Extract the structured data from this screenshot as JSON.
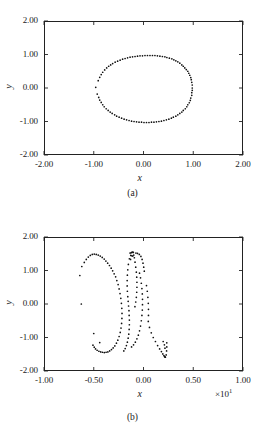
{
  "figure": {
    "panels": [
      {
        "label": "(a)",
        "xlabel": "x",
        "ylabel": "y",
        "xticks": [
          "-2.00",
          "-1.00",
          "0.00",
          "1.00",
          "2.00"
        ],
        "yticks": [
          "2.00",
          "1.00",
          "0.00",
          "-1.00",
          "-2.00"
        ],
        "xmultiplier": "",
        "xlim": [
          -2,
          2
        ],
        "ylim": [
          -2,
          2
        ]
      },
      {
        "label": "(b)",
        "xlabel": "x",
        "ylabel": "y",
        "xticks": [
          "-1.00",
          "-0.50",
          "0.00",
          "0.50",
          "1.00"
        ],
        "yticks": [
          "2.00",
          "1.00",
          "0.00",
          "-1.00",
          "-2.00"
        ],
        "xmultiplier": "×10",
        "xmultiplier_exp": "1",
        "xlim": [
          -10,
          10
        ],
        "ylim": [
          -2,
          2
        ]
      }
    ]
  },
  "chart_data": [
    {
      "type": "scatter",
      "title": "(a)",
      "xlabel": "x",
      "ylabel": "y",
      "xlim": [
        -2,
        2
      ],
      "ylim": [
        -2,
        2
      ],
      "xticks": [
        -2,
        -1,
        0,
        1,
        2
      ],
      "yticks": [
        -2,
        -1,
        0,
        1,
        2
      ],
      "grid": false,
      "legend": null,
      "marker": "dot",
      "description": "Closed ring / limit cycle of unit radius centred on the origin; dense along the upper and lower arcs, sparser on the left flank.",
      "points": [
        [
          0.98,
          0.0
        ],
        [
          0.98,
          0.09
        ],
        [
          0.97,
          0.17
        ],
        [
          0.96,
          0.25
        ],
        [
          0.95,
          0.31
        ],
        [
          0.93,
          0.38
        ],
        [
          0.91,
          0.44
        ],
        [
          0.89,
          0.5
        ],
        [
          0.86,
          0.55
        ],
        [
          0.83,
          0.6
        ],
        [
          0.8,
          0.65
        ],
        [
          0.77,
          0.69
        ],
        [
          0.73,
          0.74
        ],
        [
          0.69,
          0.78
        ],
        [
          0.65,
          0.81
        ],
        [
          0.61,
          0.84
        ],
        [
          0.57,
          0.87
        ],
        [
          0.52,
          0.89
        ],
        [
          0.47,
          0.91
        ],
        [
          0.43,
          0.93
        ],
        [
          0.38,
          0.94
        ],
        [
          0.33,
          0.95
        ],
        [
          0.28,
          0.96
        ],
        [
          0.23,
          0.97
        ],
        [
          0.18,
          0.97
        ],
        [
          0.13,
          0.97
        ],
        [
          0.08,
          0.97
        ],
        [
          0.03,
          0.97
        ],
        [
          -0.02,
          0.96
        ],
        [
          -0.07,
          0.96
        ],
        [
          -0.12,
          0.95
        ],
        [
          -0.17,
          0.94
        ],
        [
          -0.22,
          0.93
        ],
        [
          -0.27,
          0.92
        ],
        [
          -0.32,
          0.9
        ],
        [
          -0.37,
          0.88
        ],
        [
          -0.42,
          0.86
        ],
        [
          -0.47,
          0.83
        ],
        [
          -0.52,
          0.8
        ],
        [
          -0.57,
          0.77
        ],
        [
          -0.62,
          0.73
        ],
        [
          -0.66,
          0.69
        ],
        [
          -0.7,
          0.65
        ],
        [
          -0.74,
          0.6
        ],
        [
          -0.78,
          0.54
        ],
        [
          -0.82,
          0.47
        ],
        [
          -0.85,
          0.4
        ],
        [
          -0.88,
          0.32
        ],
        [
          -0.91,
          0.22
        ],
        [
          -0.96,
          0.02
        ],
        [
          -0.93,
          -0.18
        ],
        [
          -0.9,
          -0.28
        ],
        [
          -0.88,
          -0.36
        ],
        [
          -0.85,
          -0.43
        ],
        [
          -0.82,
          -0.5
        ],
        [
          -0.79,
          -0.56
        ],
        [
          -0.75,
          -0.62
        ],
        [
          -0.71,
          -0.67
        ],
        [
          -0.67,
          -0.72
        ],
        [
          -0.63,
          -0.76
        ],
        [
          -0.58,
          -0.8
        ],
        [
          -0.54,
          -0.84
        ],
        [
          -0.49,
          -0.87
        ],
        [
          -0.44,
          -0.9
        ],
        [
          -0.39,
          -0.93
        ],
        [
          -0.34,
          -0.95
        ],
        [
          -0.29,
          -0.97
        ],
        [
          -0.24,
          -0.99
        ],
        [
          -0.19,
          -1.0
        ],
        [
          -0.14,
          -1.01
        ],
        [
          -0.09,
          -1.02
        ],
        [
          -0.04,
          -1.02
        ],
        [
          0.01,
          -1.03
        ],
        [
          0.06,
          -1.03
        ],
        [
          0.11,
          -1.03
        ],
        [
          0.16,
          -1.02
        ],
        [
          0.21,
          -1.02
        ],
        [
          0.26,
          -1.01
        ],
        [
          0.31,
          -1.0
        ],
        [
          0.36,
          -0.99
        ],
        [
          0.41,
          -0.97
        ],
        [
          0.46,
          -0.95
        ],
        [
          0.51,
          -0.93
        ],
        [
          0.56,
          -0.9
        ],
        [
          0.6,
          -0.87
        ],
        [
          0.65,
          -0.84
        ],
        [
          0.69,
          -0.8
        ],
        [
          0.73,
          -0.76
        ],
        [
          0.77,
          -0.72
        ],
        [
          0.8,
          -0.67
        ],
        [
          0.84,
          -0.62
        ],
        [
          0.87,
          -0.56
        ],
        [
          0.89,
          -0.5
        ],
        [
          0.92,
          -0.44
        ],
        [
          0.94,
          -0.37
        ],
        [
          0.95,
          -0.3
        ],
        [
          0.97,
          -0.22
        ],
        [
          0.97,
          -0.14
        ],
        [
          0.98,
          -0.07
        ]
      ]
    },
    {
      "type": "scatter",
      "title": "(b)",
      "xlabel": "x",
      "ylabel": "y",
      "xlim": [
        -10,
        10
      ],
      "ylim": [
        -2,
        2
      ],
      "xticks": [
        -10,
        -5,
        0,
        5,
        10
      ],
      "yticks": [
        -2,
        -1,
        0,
        1,
        2
      ],
      "xtick_labels": [
        "-1.00",
        "-0.50",
        "0.00",
        "0.50",
        "1.00"
      ],
      "xmultiplier": 10,
      "grid": false,
      "legend": null,
      "marker": "dot",
      "description": "Chaotic / strange attractor: broad left lobe arching to y~1.5 near x=-5, a narrow near-vertical loop about x=-1 with a dense cluster at its top, and a V-shaped hook at lower right near x=2, y=-1.5.",
      "points": [
        [
          -6.4,
          0.85
        ],
        [
          -6.2,
          1.12
        ],
        [
          -5.95,
          1.24
        ],
        [
          -5.75,
          1.33
        ],
        [
          -5.55,
          1.4
        ],
        [
          -5.35,
          1.45
        ],
        [
          -5.15,
          1.48
        ],
        [
          -4.95,
          1.49
        ],
        [
          -4.75,
          1.48
        ],
        [
          -4.55,
          1.46
        ],
        [
          -4.35,
          1.43
        ],
        [
          -4.15,
          1.39
        ],
        [
          -3.95,
          1.34
        ],
        [
          -3.78,
          1.28
        ],
        [
          -3.6,
          1.22
        ],
        [
          -3.42,
          1.15
        ],
        [
          -3.25,
          1.07
        ],
        [
          -3.1,
          0.99
        ],
        [
          -2.95,
          0.9
        ],
        [
          -2.8,
          0.81
        ],
        [
          -2.68,
          0.7
        ],
        [
          -2.55,
          0.58
        ],
        [
          -2.45,
          0.45
        ],
        [
          -2.36,
          0.31
        ],
        [
          -2.28,
          0.17
        ],
        [
          -2.22,
          0.02
        ],
        [
          -2.18,
          -0.13
        ],
        [
          -2.16,
          -0.28
        ],
        [
          -2.17,
          -0.43
        ],
        [
          -2.2,
          -0.58
        ],
        [
          -2.26,
          -0.72
        ],
        [
          -2.34,
          -0.85
        ],
        [
          -2.45,
          -0.97
        ],
        [
          -2.58,
          -1.08
        ],
        [
          -2.72,
          -1.17
        ],
        [
          -2.88,
          -1.25
        ],
        [
          -3.05,
          -1.31
        ],
        [
          -3.22,
          -1.36
        ],
        [
          -3.4,
          -1.4
        ],
        [
          -3.58,
          -1.43
        ],
        [
          -3.76,
          -1.44
        ],
        [
          -3.94,
          -1.45
        ],
        [
          -4.12,
          -1.44
        ],
        [
          -4.3,
          -1.43
        ],
        [
          -4.48,
          -1.41
        ],
        [
          -4.66,
          -1.38
        ],
        [
          -4.82,
          -1.34
        ],
        [
          -4.95,
          -1.29
        ],
        [
          -5.08,
          -1.23
        ],
        [
          -6.25,
          0.0
        ],
        [
          -5.0,
          -0.88
        ],
        [
          -4.4,
          -1.15
        ],
        [
          -1.35,
          1.52
        ],
        [
          -1.25,
          1.53
        ],
        [
          -1.18,
          1.54
        ],
        [
          -1.1,
          1.55
        ],
        [
          -1.02,
          1.54
        ],
        [
          -1.28,
          1.45
        ],
        [
          -1.18,
          1.44
        ],
        [
          -1.08,
          1.43
        ],
        [
          -1.42,
          1.35
        ],
        [
          -1.3,
          1.33
        ],
        [
          -0.98,
          1.46
        ],
        [
          -0.92,
          1.38
        ],
        [
          -1.52,
          1.18
        ],
        [
          -1.58,
          1.02
        ],
        [
          -1.62,
          0.86
        ],
        [
          -1.64,
          0.7
        ],
        [
          -1.64,
          0.54
        ],
        [
          -1.62,
          0.38
        ],
        [
          -1.58,
          0.22
        ],
        [
          -1.54,
          0.08
        ],
        [
          -1.5,
          -0.06
        ],
        [
          -1.46,
          -0.2
        ],
        [
          -1.44,
          -0.34
        ],
        [
          -1.42,
          -0.48
        ],
        [
          -1.42,
          -0.62
        ],
        [
          -1.44,
          -0.76
        ],
        [
          -1.48,
          -0.9
        ],
        [
          -1.54,
          -1.02
        ],
        [
          -1.62,
          -1.14
        ],
        [
          -1.72,
          -1.24
        ],
        [
          -1.84,
          -1.33
        ],
        [
          -1.98,
          -1.4
        ],
        [
          -0.85,
          1.25
        ],
        [
          -0.78,
          1.1
        ],
        [
          -0.72,
          0.95
        ],
        [
          -0.68,
          0.8
        ],
        [
          -0.66,
          0.65
        ],
        [
          -0.66,
          0.5
        ],
        [
          -0.68,
          0.35
        ],
        [
          -0.72,
          0.2
        ],
        [
          -0.78,
          0.06
        ],
        [
          -0.86,
          -0.08
        ],
        [
          -0.4,
          0.92
        ],
        [
          -0.3,
          0.78
        ],
        [
          -0.22,
          0.62
        ],
        [
          -0.16,
          0.46
        ],
        [
          -0.12,
          0.3
        ],
        [
          -0.1,
          0.14
        ],
        [
          -0.1,
          -0.02
        ],
        [
          -0.12,
          -0.18
        ],
        [
          -0.16,
          -0.34
        ],
        [
          -0.22,
          -0.5
        ],
        [
          -0.3,
          -0.66
        ],
        [
          -0.4,
          -0.8
        ],
        [
          -0.52,
          -0.93
        ],
        [
          -0.66,
          -1.04
        ],
        [
          -0.82,
          -1.14
        ],
        [
          -1.0,
          -1.22
        ],
        [
          -1.2,
          -1.28
        ],
        [
          0.3,
          0.55
        ],
        [
          0.38,
          0.38
        ],
        [
          0.44,
          0.2
        ],
        [
          0.48,
          0.02
        ],
        [
          0.5,
          -0.16
        ],
        [
          0.5,
          -0.34
        ],
        [
          0.48,
          -0.52
        ],
        [
          0.6,
          -0.7
        ],
        [
          0.78,
          -0.86
        ],
        [
          0.98,
          -1.0
        ],
        [
          1.2,
          -1.12
        ],
        [
          1.42,
          -1.24
        ],
        [
          1.62,
          -1.34
        ],
        [
          1.8,
          -1.42
        ],
        [
          1.94,
          -1.49
        ],
        [
          2.05,
          -1.54
        ],
        [
          2.12,
          -1.57
        ],
        [
          2.16,
          -1.58
        ],
        [
          2.2,
          -1.59
        ],
        [
          2.28,
          -1.52
        ],
        [
          2.32,
          -1.4
        ],
        [
          2.34,
          -1.28
        ],
        [
          2.34,
          -1.16
        ],
        [
          2.1,
          -1.22
        ],
        [
          2.16,
          -1.32
        ],
        [
          1.98,
          -1.12
        ],
        [
          0.08,
          0.98
        ],
        [
          0.02,
          1.1
        ],
        [
          -0.05,
          1.22
        ],
        [
          -0.14,
          1.33
        ],
        [
          -0.26,
          1.42
        ],
        [
          -0.42,
          1.48
        ],
        [
          -0.6,
          1.51
        ],
        [
          -0.76,
          1.52
        ]
      ]
    }
  ]
}
